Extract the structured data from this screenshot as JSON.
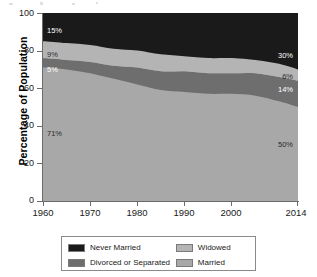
{
  "chart_data": {
    "type": "area",
    "title": "",
    "subtitle": "",
    "xlabel": "",
    "ylabel": "Percentage of Population",
    "xlim": [
      1960,
      2014
    ],
    "ylim": [
      0,
      100
    ],
    "grid": false,
    "stacked": true,
    "legend_position": "bottom",
    "x_ticks": [
      "1960",
      "1970",
      "1980",
      "1990",
      "2000",
      "2014"
    ],
    "x_tick_values": [
      1960,
      1970,
      1980,
      1990,
      2000,
      2014
    ],
    "y_ticks": [
      "0",
      "20",
      "40",
      "60",
      "80",
      "100"
    ],
    "y_tick_values": [
      0,
      20,
      40,
      60,
      80,
      100
    ],
    "x": [
      1960,
      1965,
      1970,
      1975,
      1980,
      1985,
      1990,
      1995,
      2000,
      2005,
      2010,
      2014
    ],
    "series": [
      {
        "name": "Married",
        "color": "#a8a8a8",
        "values": [
          71,
          70,
          68,
          65,
          62,
          59,
          58,
          57,
          57,
          56,
          53,
          50
        ],
        "start_label": "71%",
        "end_label": "50%"
      },
      {
        "name": "Divorced or Separated",
        "color": "#6e6e6e",
        "values": [
          5,
          5,
          6,
          7,
          9,
          10,
          11,
          11,
          11,
          12,
          13,
          14
        ],
        "start_label": "5%",
        "end_label": "14%"
      },
      {
        "name": "Widowed",
        "color": "#b4b4b4",
        "values": [
          9,
          9,
          9,
          9,
          9,
          9,
          8,
          8,
          8,
          7,
          7,
          6
        ],
        "start_label": "9%",
        "end_label": "6%"
      },
      {
        "name": "Never Married",
        "color": "#1a1a1a",
        "values": [
          15,
          16,
          17,
          19,
          20,
          22,
          23,
          24,
          24,
          25,
          27,
          30
        ],
        "start_label": "15%",
        "end_label": "30%"
      }
    ],
    "annotations": [
      {
        "text": "15%",
        "series": "Never Married",
        "side": "left"
      },
      {
        "text": "9%",
        "series": "Widowed",
        "side": "left"
      },
      {
        "text": "5%",
        "series": "Divorced or Separated",
        "side": "left"
      },
      {
        "text": "71%",
        "series": "Married",
        "side": "left"
      },
      {
        "text": "30%",
        "series": "Never Married",
        "side": "right"
      },
      {
        "text": "6%",
        "series": "Widowed",
        "side": "right"
      },
      {
        "text": "14%",
        "series": "Divorced or Separated",
        "side": "right"
      },
      {
        "text": "50%",
        "series": "Married",
        "side": "right"
      }
    ]
  },
  "legend": {
    "rows": [
      [
        {
          "label": "Never Married",
          "color": "#1a1a1a"
        },
        {
          "label": "Widowed",
          "color": "#b4b4b4"
        }
      ],
      [
        {
          "label": "Divorced or Separated",
          "color": "#6e6e6e"
        },
        {
          "label": "Married",
          "color": "#a8a8a8"
        }
      ]
    ]
  }
}
